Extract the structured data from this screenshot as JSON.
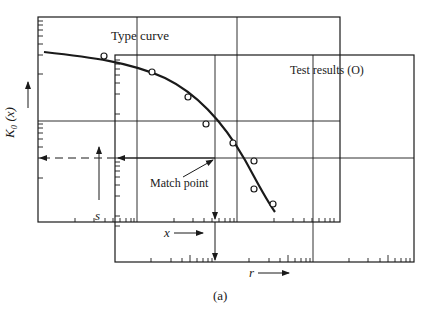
{
  "figure": {
    "caption": "(a)",
    "type_curve_label": "Type curve",
    "test_results_label": "Test results (O)",
    "match_point_label": "Match point",
    "y_axis_label_type": "K₀ (x)",
    "y_axis_label_test": "s",
    "x_axis_label_type": "x",
    "x_axis_label_test": "r",
    "colors": {
      "ink": "#1a1a1a",
      "background": "#ffffff"
    }
  },
  "diagram": {
    "panels": [
      {
        "id": "type-curve-sheet",
        "description": "Log-log sheet with type curve K0(x) vs x"
      },
      {
        "id": "test-results-sheet",
        "description": "Overlaid log-log sheet with test data s vs r, shifted right and down"
      }
    ],
    "annotations": [
      {
        "id": "match-point",
        "description": "Chosen match point where grids align; projected horizontally to both vertical axes and vertically to both horizontal axes"
      }
    ],
    "test_points_count": 8
  }
}
